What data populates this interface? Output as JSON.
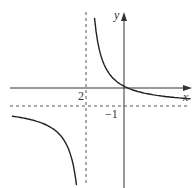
{
  "chart_data": {
    "type": "line",
    "title": "",
    "xlabel": "x",
    "ylabel": "y",
    "function_description": "Rectangular hyperbola with vertical asymptote x = -2 and horizontal asymptote y = -1",
    "asymptotes": {
      "vertical": {
        "x": -2,
        "label": "2"
      },
      "horizontal": {
        "y": -1,
        "label": "−1"
      }
    },
    "xlim": [
      -5,
      3
    ],
    "ylim": [
      -4,
      4
    ],
    "grid": false,
    "series": [
      {
        "name": "upper-right branch",
        "x": [
          -1.8,
          -1.5,
          -1.0,
          -0.5,
          0,
          0.5,
          1.0,
          2.0,
          3.0
        ],
        "y": [
          4.0,
          2.6,
          1.2,
          0.5,
          0.1,
          -0.15,
          -0.3,
          -0.5,
          -0.6
        ]
      },
      {
        "name": "lower-left branch",
        "x": [
          -5,
          -4.5,
          -4,
          -3.5,
          -3,
          -2.5,
          -2.2
        ],
        "y": [
          -2.0,
          -2.2,
          -2.5,
          -2.9,
          -3.4,
          -4.2,
          -5.0
        ]
      }
    ],
    "tick_labels": {
      "x": [
        "2"
      ],
      "y": [
        "−1"
      ]
    }
  }
}
